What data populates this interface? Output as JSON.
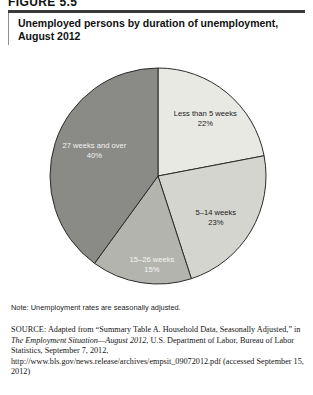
{
  "figure": {
    "number_label": "FIGURE 5.5"
  },
  "title": {
    "line1": "Unemployed persons by duration of unemployment,",
    "line2": "August 2012"
  },
  "chart_data": {
    "type": "pie",
    "title": "Unemployed persons by duration of unemployment, August 2012",
    "subtitle": "",
    "xlabel": "",
    "ylabel": "",
    "units": "percent",
    "start_angle_deg": 0,
    "direction": "clockwise",
    "legend_position": "none",
    "labels_inside_slices": true,
    "categories": [
      "Less than 5 weeks",
      "5–14 weeks",
      "15–26 weeks",
      "27 weeks and over"
    ],
    "values": [
      22,
      23,
      15,
      40
    ],
    "value_labels": [
      "22%",
      "23%",
      "15%",
      "40%"
    ],
    "colors": [
      "#e9e9e4",
      "#d5d5d0",
      "#b4b4af",
      "#8a8a86"
    ],
    "slices": [
      {
        "label": "Less than 5 weeks",
        "value": 22,
        "value_label": "22%",
        "color": "#e9e9e4",
        "label_text_class": "onlight"
      },
      {
        "label": "5–14 weeks",
        "value": 23,
        "value_label": "23%",
        "color": "#d5d5d0",
        "label_text_class": "onlight"
      },
      {
        "label": "15–26 weeks",
        "value": 15,
        "value_label": "15%",
        "color": "#b4b4af",
        "label_text_class": "onmid"
      },
      {
        "label": "27 weeks and over",
        "value": 40,
        "value_label": "40%",
        "color": "#8a8a86",
        "label_text_class": "ondark"
      }
    ]
  },
  "note": {
    "text": "Note: Unemployment rates are seasonally adjusted."
  },
  "source": {
    "label": "SOURCE:",
    "part1": " Adapted from “Summary Table A. Household Data, Seasonally Adjusted,” in ",
    "italic1": "The Employment Situation—August 2012",
    "part2": ", U.S. Department of Labor, Bureau of Labor Statistics, September 7, 2012, ",
    "url": "http://www.bls.gov/news.release/archives/empsit_09072012.pdf",
    "part3": " (accessed September 15, 2012)"
  }
}
